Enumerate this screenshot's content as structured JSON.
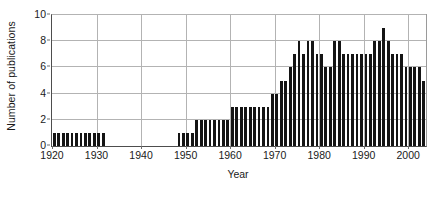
{
  "chart_data": {
    "type": "bar",
    "title": "",
    "xlabel": "Year",
    "ylabel": "Number of publications",
    "xlim": [
      1920,
      2004
    ],
    "ylim": [
      0,
      10
    ],
    "ytick_labels": [
      "0",
      "2",
      "4",
      "6",
      "8",
      "10"
    ],
    "ytick_values": [
      0,
      2,
      4,
      6,
      8,
      10
    ],
    "xtick_labels": [
      "1920",
      "1930",
      "1940",
      "1950",
      "1960",
      "1970",
      "1980",
      "1990",
      "2000"
    ],
    "xtick_values": [
      1920,
      1930,
      1940,
      1950,
      1960,
      1970,
      1980,
      1990,
      2000
    ],
    "grid": "horizontal-and-vertical",
    "legend": "none",
    "bar_color": "#141414",
    "categories": [
      1920,
      1921,
      1922,
      1923,
      1924,
      1925,
      1926,
      1927,
      1928,
      1929,
      1930,
      1931,
      1932,
      1933,
      1934,
      1935,
      1936,
      1937,
      1938,
      1939,
      1940,
      1941,
      1942,
      1943,
      1944,
      1945,
      1946,
      1947,
      1948,
      1949,
      1950,
      1951,
      1952,
      1953,
      1954,
      1955,
      1956,
      1957,
      1958,
      1959,
      1960,
      1961,
      1962,
      1963,
      1964,
      1965,
      1966,
      1967,
      1968,
      1969,
      1970,
      1971,
      1972,
      1973,
      1974,
      1975,
      1976,
      1977,
      1978,
      1979,
      1980,
      1981,
      1982,
      1983,
      1984,
      1985,
      1986,
      1987,
      1988,
      1989,
      1990,
      1991,
      1992,
      1993,
      1994,
      1995,
      1996,
      1997,
      1998,
      1999,
      2000,
      2001,
      2002,
      2003
    ],
    "values": [
      1,
      1,
      1,
      1,
      1,
      1,
      1,
      1,
      1,
      1,
      1,
      1,
      0,
      0,
      0,
      0,
      0,
      0,
      0,
      0,
      0,
      0,
      0,
      0,
      0,
      0,
      0,
      0,
      1,
      1,
      1,
      1,
      2,
      2,
      2,
      2,
      2,
      2,
      2,
      2,
      3,
      3,
      3,
      3,
      3,
      3,
      3,
      3,
      3,
      4,
      4,
      5,
      5,
      6,
      7,
      8,
      7,
      8,
      8,
      7,
      7,
      6,
      6,
      8,
      8,
      7,
      7,
      7,
      7,
      7,
      7,
      7,
      8,
      8,
      9,
      8,
      7,
      7,
      7,
      6,
      6,
      6,
      6,
      5
    ]
  }
}
